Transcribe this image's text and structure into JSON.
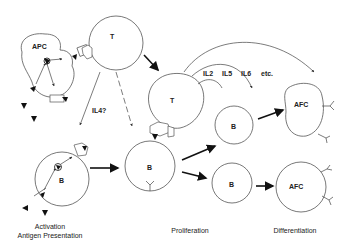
{
  "diagram": {
    "cells": {
      "apc": "APC",
      "t_top": "T",
      "t_mid": "T",
      "b_left": "B",
      "b_center": "B",
      "b_upper_right": "B",
      "b_lower_right": "B",
      "afc_upper": "AFC",
      "afc_lower": "AFC"
    },
    "cytokines": {
      "il4": "IL4?",
      "il2": "IL2",
      "il5": "IL5",
      "il6": "IL6",
      "etc": "etc."
    },
    "stages": {
      "activation_line1": "Activation",
      "activation_line2": "Antigen Presentation",
      "proliferation": "Proliferation",
      "differentiation": "Differentiation"
    },
    "colors": {
      "stroke": "#555555",
      "arrow": "#111111",
      "text": "#222222",
      "background": "#ffffff"
    }
  }
}
